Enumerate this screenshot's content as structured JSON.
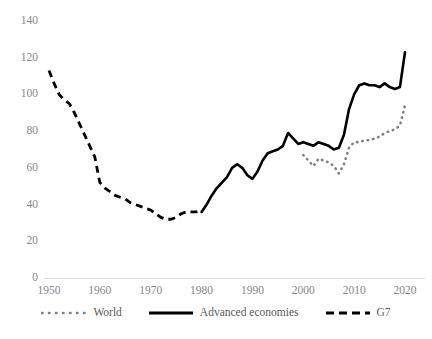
{
  "chart_data": {
    "type": "line",
    "title": "",
    "xlabel": "",
    "ylabel": "",
    "xlim": [
      1950,
      2021
    ],
    "ylim": [
      0,
      140
    ],
    "grid": false,
    "legend_position": "bottom",
    "yticks": [
      0,
      20,
      40,
      60,
      80,
      100,
      120,
      140
    ],
    "xticks": [
      1950,
      1960,
      1970,
      1980,
      1990,
      2000,
      2010,
      2020
    ],
    "series": [
      {
        "name": "World",
        "style": "dotted",
        "color": "#808080",
        "x": [
          2000,
          2001,
          2002,
          2003,
          2004,
          2005,
          2006,
          2007,
          2008,
          2009,
          2010,
          2011,
          2012,
          2013,
          2014,
          2015,
          2016,
          2017,
          2018,
          2019,
          2020
        ],
        "values": [
          67,
          64,
          61,
          65,
          64,
          63,
          61,
          57,
          62,
          71,
          74,
          74,
          75,
          75,
          76,
          77,
          79,
          80,
          81,
          83,
          94
        ]
      },
      {
        "name": "Advanced economies",
        "style": "solid",
        "color": "#000000",
        "x": [
          1980,
          1981,
          1982,
          1983,
          1984,
          1985,
          1986,
          1987,
          1988,
          1989,
          1990,
          1991,
          1992,
          1993,
          1994,
          1995,
          1996,
          1997,
          1998,
          1999,
          2000,
          2001,
          2002,
          2003,
          2004,
          2005,
          2006,
          2007,
          2008,
          2009,
          2010,
          2011,
          2012,
          2013,
          2014,
          2015,
          2016,
          2017,
          2018,
          2019,
          2020
        ],
        "values": [
          36,
          40,
          45,
          49,
          52,
          55,
          60,
          62,
          60,
          56,
          54,
          58,
          64,
          68,
          69,
          70,
          72,
          79,
          76,
          73,
          74,
          73,
          72,
          74,
          73,
          72,
          70,
          71,
          78,
          92,
          100,
          105,
          106,
          105,
          105,
          104,
          106,
          104,
          103,
          104,
          123
        ]
      },
      {
        "name": "G7",
        "style": "dashed",
        "color": "#000000",
        "x": [
          1950,
          1951,
          1952,
          1953,
          1954,
          1955,
          1956,
          1957,
          1958,
          1959,
          1960,
          1961,
          1962,
          1963,
          1964,
          1965,
          1966,
          1967,
          1968,
          1969,
          1970,
          1971,
          1972,
          1973,
          1974,
          1975,
          1976,
          1977,
          1978,
          1979,
          1980
        ],
        "values": [
          113,
          106,
          100,
          97,
          95,
          90,
          84,
          78,
          72,
          66,
          52,
          49,
          47,
          45,
          44,
          43,
          41,
          40,
          39,
          38,
          37,
          35,
          33,
          32,
          32,
          33,
          35,
          36,
          36,
          36,
          37
        ]
      }
    ]
  },
  "axis": {
    "line_color": "#d9d9d9",
    "tick_color": "#868686"
  },
  "legend": {
    "items": [
      {
        "label": "World",
        "swatch": "dotted-line-swatch"
      },
      {
        "label": "Advanced economies",
        "swatch": "solid-line-swatch"
      },
      {
        "label": "G7",
        "swatch": "dashed-line-swatch"
      }
    ]
  }
}
